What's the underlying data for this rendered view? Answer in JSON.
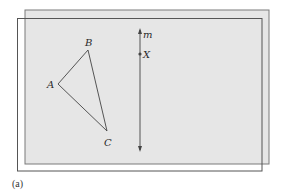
{
  "figure": {
    "caption": "(a)",
    "colors": {
      "sheet_fill": "#e6e6e6",
      "sheet_border": "#7a7a7a",
      "front_border": "#555555",
      "line": "#444444",
      "label": "#2a2a2a"
    },
    "back_sheet": {
      "x": 25,
      "y": 10,
      "w": 244,
      "h": 154
    },
    "front_sheet": {
      "x": 17,
      "y": 18,
      "w": 245,
      "h": 153
    },
    "triangle": {
      "vertices": [
        {
          "name": "A",
          "x": 58,
          "y": 84
        },
        {
          "name": "B",
          "x": 88,
          "y": 50
        },
        {
          "name": "C",
          "x": 107,
          "y": 131
        }
      ]
    },
    "line_m": {
      "label": "m",
      "x": 140,
      "y1": 29,
      "y2": 151
    },
    "point_X": {
      "label": "X",
      "x": 140,
      "y": 54
    }
  },
  "labels": {
    "A": "A",
    "B": "B",
    "C": "C",
    "m": "m",
    "X": "X",
    "caption": "(a)"
  }
}
